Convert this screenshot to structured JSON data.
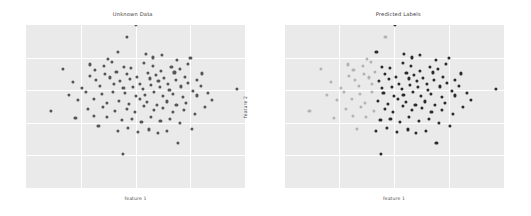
{
  "figure": {
    "background_color": "#ffffff",
    "width": 531,
    "height": 216
  },
  "panels": [
    {
      "id": "unknown-data",
      "title": "Unknown Data",
      "xlabel": "feature 1",
      "ylabel": "feature 2"
    },
    {
      "id": "predicted-labels",
      "title": "Predicted Labels",
      "xlabel": "feature 1",
      "ylabel": "feature 2"
    }
  ],
  "style": {
    "plot_background": "#eaeaea",
    "gridline_color": "#ffffff",
    "title_color": "#3c3c3c",
    "label_color": "#4a4a4a",
    "unlabeled_point_color": "#555555",
    "cluster_0_color": "#b3b3b3",
    "cluster_1_color": "#2a2a2a"
  },
  "chart_data": [
    {
      "type": "scatter",
      "title": "Unknown Data",
      "xlabel": "feature 1",
      "ylabel": "feature 2",
      "xlim": [
        0,
        100
      ],
      "ylim": [
        0,
        100
      ],
      "grid": true,
      "xticks": [],
      "yticks": [],
      "legend": null,
      "series": [
        {
          "name": "unlabeled",
          "color": "#555555",
          "x": [
            46.1,
            42.0,
            37.6,
            39.4,
            35.8,
            54.7,
            58.1,
            62.0,
            69.1,
            73.9,
            75.1,
            16.8,
            29.0,
            31.5,
            53.9,
            44.7,
            48.1,
            57.9,
            61.8,
            66.4,
            70.2,
            80.4,
            29.4,
            36.1,
            41.3,
            46.0,
            50.8,
            55.7,
            59.3,
            63.1,
            67.8,
            72.5,
            77.9,
            21.3,
            32.0,
            38.5,
            43.1,
            47.6,
            52.2,
            56.8,
            60.5,
            64.9,
            68.3,
            74.1,
            79.8,
            25.7,
            33.8,
            40.0,
            44.5,
            49.0,
            53.5,
            57.2,
            61.0,
            65.5,
            70.8,
            76.3,
            83.2,
            96.5,
            19.5,
            27.3,
            34.6,
            39.9,
            45.2,
            50.1,
            54.3,
            58.6,
            62.4,
            66.9,
            71.7,
            78.0,
            85.1,
            11.4,
            23.8,
            30.9,
            36.8,
            42.5,
            47.2,
            51.9,
            55.4,
            59.8,
            64.2,
            68.7,
            73.2,
            81.6,
            28.1,
            35.0,
            40.7,
            45.9,
            49.6,
            54.0,
            58.3,
            62.7,
            67.1,
            72.0,
            77.1,
            22.6,
            31.2,
            37.1,
            43.8,
            48.4,
            52.7,
            57.0,
            61.4,
            65.8,
            70.5,
            75.6,
            33.1,
            41.9,
            46.7,
            51.3,
            56.2,
            60.1,
            64.5,
            69.4,
            44.2,
            50.4
          ],
          "y": [
            92.8,
            83.5,
            79.2,
            77.1,
            74.9,
            82.3,
            80.1,
            81.7,
            78.4,
            76.2,
            79.8,
            73.1,
            75.8,
            72.4,
            76.9,
            74.2,
            73.6,
            75.1,
            71.8,
            74.5,
            72.9,
            70.3,
            68.7,
            70.1,
            71.4,
            69.8,
            68.2,
            70.6,
            69.1,
            67.5,
            70.9,
            68.4,
            66.2,
            64.9,
            66.3,
            67.8,
            65.4,
            66.9,
            64.1,
            67.2,
            65.8,
            63.7,
            66.5,
            64.3,
            62.8,
            61.2,
            62.7,
            63.9,
            61.5,
            62.1,
            60.8,
            63.2,
            61.9,
            60.4,
            62.3,
            59.7,
            58.1,
            60.5,
            57.3,
            58.8,
            57.9,
            59.2,
            58.4,
            56.7,
            57.1,
            58.9,
            56.3,
            57.6,
            55.9,
            56.8,
            54.2,
            47.5,
            53.8,
            54.6,
            52.1,
            53.4,
            51.7,
            54.9,
            52.6,
            51.2,
            53.1,
            50.8,
            52.4,
            49.6,
            48.3,
            49.7,
            47.2,
            48.6,
            46.9,
            50.1,
            47.8,
            49.3,
            46.4,
            48.1,
            45.7,
            42.8,
            44.1,
            43.5,
            41.9,
            42.6,
            40.3,
            43.8,
            41.1,
            42.2,
            39.8,
            36.4,
            37.9,
            35.1,
            36.8,
            34.2,
            35.9,
            33.6,
            34.8,
            27.5,
            21.1
          ]
        }
      ]
    },
    {
      "type": "scatter",
      "title": "Predicted Labels",
      "xlabel": "feature 1",
      "ylabel": "feature 2",
      "xlim": [
        0,
        100
      ],
      "ylim": [
        0,
        100
      ],
      "grid": true,
      "xticks": [],
      "yticks": [],
      "legend": null,
      "series": [
        {
          "name": "cluster 0",
          "color": "#b3b3b3",
          "x": [
            46.1,
            37.6,
            39.4,
            35.8,
            16.8,
            29.0,
            31.5,
            29.4,
            36.1,
            41.3,
            21.3,
            32.0,
            38.5,
            25.7,
            33.8,
            40.0,
            19.5,
            27.3,
            34.6,
            39.9,
            11.4,
            23.8,
            30.9,
            36.8,
            28.1,
            35.0,
            40.7,
            22.6,
            31.2,
            37.1,
            33.1
          ],
          "y": [
            92.8,
            79.2,
            77.1,
            74.9,
            73.1,
            75.8,
            72.4,
            68.7,
            70.1,
            71.4,
            64.9,
            66.3,
            67.8,
            61.2,
            62.7,
            63.9,
            57.3,
            58.8,
            57.9,
            59.2,
            47.5,
            53.8,
            54.6,
            52.1,
            48.3,
            49.7,
            47.2,
            42.8,
            44.1,
            43.5,
            36.4
          ]
        },
        {
          "name": "cluster 1",
          "color": "#2a2a2a",
          "x": [
            42.0,
            54.7,
            58.1,
            62.0,
            69.1,
            73.9,
            75.1,
            53.9,
            44.7,
            48.1,
            57.9,
            61.8,
            66.4,
            70.2,
            80.4,
            46.0,
            50.8,
            55.7,
            59.3,
            63.1,
            67.8,
            72.5,
            77.9,
            43.1,
            47.6,
            52.2,
            56.8,
            60.5,
            64.9,
            68.3,
            74.1,
            79.8,
            44.5,
            49.0,
            53.5,
            57.2,
            61.0,
            65.5,
            70.8,
            76.3,
            83.2,
            96.5,
            45.2,
            50.1,
            54.3,
            58.6,
            62.4,
            66.9,
            71.7,
            78.0,
            85.1,
            42.5,
            47.2,
            51.9,
            55.4,
            59.8,
            64.2,
            68.7,
            73.2,
            81.6,
            45.9,
            49.6,
            54.0,
            58.3,
            62.7,
            67.1,
            72.0,
            77.1,
            43.8,
            48.4,
            52.7,
            57.0,
            61.4,
            65.8,
            70.5,
            75.6,
            41.9,
            46.7,
            51.3,
            56.2,
            60.1,
            64.5,
            69.4,
            44.2,
            50.4
          ],
          "y": [
            83.5,
            82.3,
            80.1,
            81.7,
            78.4,
            76.2,
            79.8,
            76.9,
            74.2,
            73.6,
            75.1,
            71.8,
            74.5,
            72.9,
            70.3,
            69.8,
            68.2,
            70.6,
            69.1,
            67.5,
            70.9,
            68.4,
            66.2,
            65.4,
            66.9,
            64.1,
            67.2,
            65.8,
            63.7,
            66.5,
            64.3,
            62.8,
            61.5,
            62.1,
            60.8,
            63.2,
            61.9,
            60.4,
            62.3,
            59.7,
            58.1,
            60.5,
            58.4,
            56.7,
            57.1,
            58.9,
            56.3,
            57.6,
            55.9,
            56.8,
            54.2,
            53.4,
            51.7,
            54.9,
            52.6,
            51.2,
            53.1,
            50.8,
            52.4,
            49.6,
            48.6,
            46.9,
            50.1,
            47.8,
            49.3,
            46.4,
            48.1,
            45.7,
            41.9,
            42.6,
            40.3,
            43.8,
            41.1,
            42.2,
            39.8,
            37.9,
            35.1,
            36.8,
            34.2,
            35.9,
            33.6,
            34.8,
            27.5,
            21.1
          ]
        }
      ]
    }
  ]
}
